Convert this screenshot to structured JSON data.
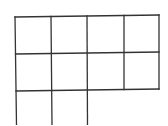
{
  "diagram": {
    "type": "grid",
    "rows": [
      {
        "cells": 4
      },
      {
        "cells": 4
      },
      {
        "cells": 2
      }
    ],
    "total_cells": 10,
    "line_color": "#333333",
    "background": "#ffffff"
  }
}
